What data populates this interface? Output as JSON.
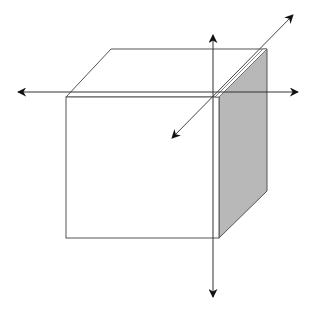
{
  "diagram": {
    "title": "",
    "colors": {
      "background": "#ffffff",
      "edge": "#555555",
      "axis": "#333333",
      "arrowhead": "#111111",
      "shaded_face": "#b8b8b8"
    },
    "cube": {
      "front_face": {
        "x1": 66,
        "y1": 97,
        "x2": 219,
        "y2": 238
      },
      "top_face_back_left": [
        111,
        49
      ],
      "top_face_back_right": [
        267,
        49
      ],
      "side_face_bottom_back": [
        267,
        191
      ]
    },
    "axes": [
      {
        "name": "horizontal-axis",
        "from": [
          18,
          92
        ],
        "to": [
          298,
          92
        ],
        "bidirectional": true
      },
      {
        "name": "vertical-axis",
        "from": [
          213,
          35
        ],
        "to": [
          213,
          297
        ],
        "bidirectional": true
      },
      {
        "name": "depth-axis",
        "from": [
          172,
          138
        ],
        "to": [
          293,
          15
        ],
        "bidirectional": true
      }
    ]
  }
}
